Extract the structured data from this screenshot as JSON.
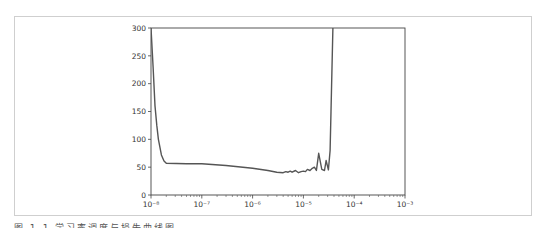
{
  "chart_data": {
    "type": "line",
    "title": "",
    "xlabel": "",
    "ylabel": "",
    "xscale": "log",
    "xlim": [
      1e-08,
      0.001
    ],
    "ylim": [
      0,
      300
    ],
    "grid": false,
    "legend": null,
    "x_tick_labels": [
      "10⁻⁸",
      "10⁻⁷",
      "10⁻⁶",
      "10⁻⁵",
      "10⁻⁴",
      "10⁻³"
    ],
    "y_tick_labels": [
      "0",
      "50",
      "100",
      "150",
      "200",
      "250",
      "300"
    ],
    "series": [
      {
        "name": "loss",
        "color": "#555555",
        "x": [
          1e-08,
          1.1e-08,
          1.2e-08,
          1.3e-08,
          1.4e-08,
          1.6e-08,
          1.8e-08,
          2e-08,
          5e-08,
          1e-07,
          3e-07,
          1e-06,
          2e-06,
          3e-06,
          4e-06,
          4.5e-06,
          5e-06,
          5.5e-06,
          6e-06,
          7e-06,
          8e-06,
          9e-06,
          1e-05,
          1.1e-05,
          1.2e-05,
          1.35e-05,
          1.5e-05,
          1.65e-05,
          1.8e-05,
          2e-05,
          2.3e-05,
          2.6e-05,
          2.8e-05,
          3.1e-05,
          3.35e-05,
          3.5e-05,
          3.8e-05
        ],
        "values": [
          300,
          230,
          160,
          125,
          100,
          72,
          61,
          57,
          56,
          56,
          53,
          48,
          44,
          41,
          40,
          42,
          41,
          43,
          41,
          44,
          40,
          42,
          43,
          42,
          46,
          44,
          48,
          50,
          44,
          75,
          46,
          44,
          62,
          45,
          80,
          150,
          300
        ]
      }
    ]
  },
  "caption": {
    "text": "图 1-1  学习率调度与损失曲线图"
  }
}
